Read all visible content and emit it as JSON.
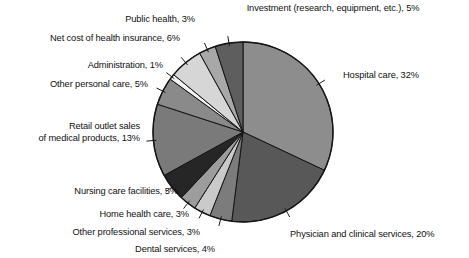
{
  "chart_data": {
    "type": "pie",
    "title": "",
    "subtitle": "",
    "xlabel": "",
    "ylabel": "",
    "legend_position": "none",
    "grid": false,
    "labels_on_slices": false,
    "start_angle_deg": 0,
    "direction": "clockwise",
    "units": "percent",
    "categories": [
      "Hospital care",
      "Physician and clinical services",
      "Dental services",
      "Other professional services",
      "Home health care",
      "Nursing care facilities",
      "Retail outlet sales of medical products",
      "Other personal care",
      "Administration",
      "Net cost of health insurance",
      "Public health",
      "Investment (research, equipment, etc.)"
    ],
    "values": [
      32,
      20,
      4,
      3,
      3,
      5,
      13,
      5,
      1,
      6,
      3,
      5
    ],
    "colors": [
      "#8d8d8d",
      "#585858",
      "#7c7c7c",
      "#cacaca",
      "#9d9d9d",
      "#262626",
      "#7a7a7a",
      "#8a8a8a",
      "#f2f2f2",
      "#d6d6d6",
      "#a8a8a8",
      "#5e5e5e"
    ],
    "slice_labels": [
      "Hospital care, 32%",
      "Physician and clinical services, 20%",
      "Dental services, 4%",
      "Other professional services, 3%",
      "Home health care, 3%",
      "Nursing care facilities, 5%",
      "Retail outlet sales of medical products, 13%",
      "Other personal care, 5%",
      "Administration, 1%",
      "Net cost of health insurance, 6%",
      "Public health, 3%",
      "Investment (research, equipment, etc.), 5%"
    ]
  },
  "callouts": {
    "investment": "Investment (research, equipment, etc.), 5%",
    "public_health": "Public health, 3%",
    "net_cost_insurance": "Net cost of health insurance, 6%",
    "administration": "Administration, 1%",
    "other_personal_care": "Other personal care, 5%",
    "retail_line1": "Retail outlet sales",
    "retail_line2": "of medical products, 13%",
    "nursing_care": "Nursing care facilities, 5%",
    "home_health": "Home health care, 3%",
    "other_professional": "Other professional services, 3%",
    "dental": "Dental services, 4%",
    "physician": "Physician and clinical services, 20%",
    "hospital": "Hospital care, 32%"
  }
}
